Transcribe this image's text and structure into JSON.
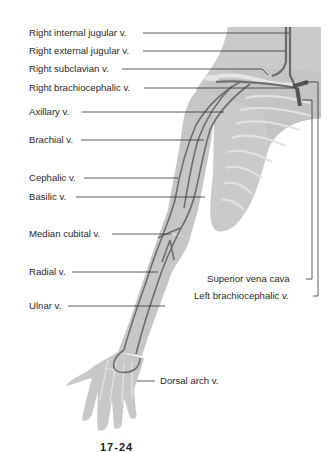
{
  "figure": {
    "caption_fragment": "17-24"
  },
  "labels_left": [
    {
      "id": "right-internal-jugular",
      "text": "Right internal jugular v."
    },
    {
      "id": "right-external-jugular",
      "text": "Right external jugular v."
    },
    {
      "id": "right-subclavian",
      "text": "Right subclavian v."
    },
    {
      "id": "right-brachiocephalic",
      "text": "Right brachiocephalic v."
    },
    {
      "id": "axillary",
      "text": "Axillary v."
    },
    {
      "id": "brachial",
      "text": "Brachial v."
    },
    {
      "id": "cephalic",
      "text": "Cephalic v."
    },
    {
      "id": "basilic",
      "text": "Basilic v."
    },
    {
      "id": "median-cubital",
      "text": "Median cubital v."
    },
    {
      "id": "radial",
      "text": "Radial v."
    },
    {
      "id": "ulnar",
      "text": "Ulnar v."
    }
  ],
  "labels_right": [
    {
      "id": "superior-vena-cava",
      "text": "Superior vena cava"
    },
    {
      "id": "left-brachiocephalic",
      "text": "Left brachiocephalic v."
    },
    {
      "id": "dorsal-arch",
      "text": "Dorsal arch v."
    }
  ],
  "colors": {
    "skin_fill": "#c9c9c9",
    "skin_light": "#dcdcdc",
    "vein": "#6e6e6e",
    "vein_dark": "#555555",
    "leader_line": "#333333",
    "text": "#2a2a2a"
  }
}
